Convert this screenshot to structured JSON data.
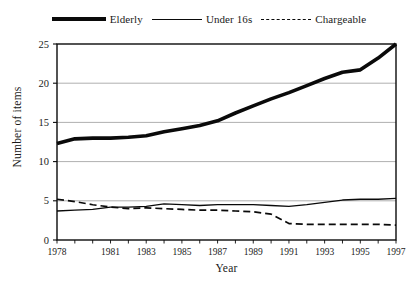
{
  "chart_data": {
    "type": "line",
    "title": "",
    "xlabel": "Year",
    "ylabel": "Number of items",
    "xlim": [
      1978,
      1997
    ],
    "ylim": [
      0,
      25
    ],
    "yticks": [
      0,
      5,
      10,
      15,
      20,
      25
    ],
    "xticks": [
      1978,
      1981,
      1983,
      1985,
      1987,
      1989,
      1991,
      1993,
      1995,
      1997
    ],
    "xtick_labels": [
      "1978",
      "1981",
      "1983",
      "1985",
      "1987",
      "1989",
      "1991",
      "1993",
      "1995",
      "1997"
    ],
    "ytick_labels": [
      "0",
      "5",
      "10",
      "15",
      "20",
      "25"
    ],
    "grid": "horizontal",
    "legend_position": "top-center",
    "x": [
      1978,
      1979,
      1980,
      1981,
      1982,
      1983,
      1984,
      1985,
      1986,
      1987,
      1988,
      1989,
      1990,
      1991,
      1992,
      1993,
      1994,
      1995,
      1996,
      1997
    ],
    "series": [
      {
        "name": "Elderly",
        "style": "solid-thick",
        "color": "#0a0a0a",
        "values": [
          12.3,
          12.9,
          13.0,
          13.0,
          13.1,
          13.3,
          13.8,
          14.2,
          14.6,
          15.2,
          16.2,
          17.1,
          18.0,
          18.8,
          19.7,
          20.6,
          21.4,
          21.7,
          23.2,
          25.0
        ]
      },
      {
        "name": "Under 16s",
        "style": "solid-thin",
        "color": "#0a0a0a",
        "values": [
          3.7,
          3.8,
          3.9,
          4.2,
          4.2,
          4.3,
          4.6,
          4.5,
          4.4,
          4.5,
          4.5,
          4.5,
          4.4,
          4.3,
          4.5,
          4.8,
          5.1,
          5.2,
          5.2,
          5.3
        ]
      },
      {
        "name": "Chargeable",
        "style": "dashed",
        "color": "#0a0a0a",
        "values": [
          5.2,
          4.9,
          4.5,
          4.2,
          4.0,
          4.1,
          4.0,
          3.9,
          3.8,
          3.8,
          3.7,
          3.6,
          3.3,
          2.1,
          2.0,
          2.0,
          2.0,
          2.0,
          2.0,
          1.9
        ]
      }
    ]
  },
  "legend": {
    "entries": [
      {
        "label": "Elderly",
        "swatch": "thick-solid-line-swatch"
      },
      {
        "label": "Under 16s",
        "swatch": "thin-solid-line-swatch"
      },
      {
        "label": "Chargeable",
        "swatch": "dashed-line-swatch"
      }
    ]
  },
  "axes": {
    "x_title": "Year",
    "y_title": "Number of items"
  }
}
